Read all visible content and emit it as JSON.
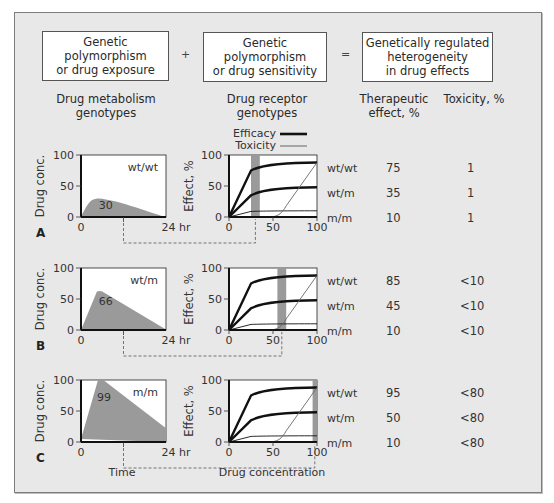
{
  "header": {
    "box1": "Genetic polymorphism or drug exposure",
    "box1_lines": [
      "Genetic polymorphism",
      "or drug exposure"
    ],
    "plus": "+",
    "box2_lines": [
      "Genetic",
      "polymorphism",
      "or drug sensitivity"
    ],
    "equals": "=",
    "box3_lines": [
      "Genetically regulated",
      "heterogeneity",
      "in drug effects"
    ]
  },
  "column_labels": {
    "metabolism": [
      "Drug metabolism",
      "genotypes"
    ],
    "receptor": [
      "Drug receptor",
      "genotypes"
    ],
    "therapeutic": [
      "Therapeutic",
      "effect, %"
    ],
    "toxicity": "Toxicity, %"
  },
  "legend": {
    "efficacy": "Efficacy",
    "toxicity": "Toxicity"
  },
  "axes": {
    "conc_ylabel": "Drug conc.",
    "effect_ylabel": "Effect, %",
    "conc_yticks": [
      "100",
      "50",
      "0"
    ],
    "conc_xticks": [
      "0",
      "24 hr"
    ],
    "effect_yticks": [
      "100",
      "50",
      "0"
    ],
    "effect_xticks": [
      "0",
      "50",
      "100"
    ],
    "time_label": "Time",
    "drug_conc_label": "Drug concentration"
  },
  "receptor_genotypes": [
    "wt/wt",
    "wt/m",
    "m/m"
  ],
  "panels": [
    {
      "letter": "A",
      "metabolism_genotype": "wt/wt",
      "peak_conc_label": "30",
      "peak_conc": 30,
      "shaded_band": [
        25,
        35
      ],
      "rows": [
        {
          "genotype": "wt/wt",
          "therapeutic": "75",
          "toxicity": "1"
        },
        {
          "genotype": "wt/m",
          "therapeutic": "35",
          "toxicity": "1"
        },
        {
          "genotype": "m/m",
          "therapeutic": "10",
          "toxicity": "1"
        }
      ]
    },
    {
      "letter": "B",
      "metabolism_genotype": "wt/m",
      "peak_conc_label": "66",
      "peak_conc": 63,
      "shaded_band": [
        55,
        65
      ],
      "rows": [
        {
          "genotype": "wt/wt",
          "therapeutic": "85",
          "toxicity": "<10"
        },
        {
          "genotype": "wt/m",
          "therapeutic": "45",
          "toxicity": "<10"
        },
        {
          "genotype": "m/m",
          "therapeutic": "10",
          "toxicity": "<10"
        }
      ]
    },
    {
      "letter": "C",
      "metabolism_genotype": "m/m",
      "peak_conc_label": "99",
      "peak_conc": 100,
      "shaded_band": [
        95,
        105
      ],
      "rows": [
        {
          "genotype": "wt/wt",
          "therapeutic": "95",
          "toxicity": "<80"
        },
        {
          "genotype": "wt/m",
          "therapeutic": "50",
          "toxicity": "<80"
        },
        {
          "genotype": "m/m",
          "therapeutic": "10",
          "toxicity": "<80"
        }
      ]
    }
  ],
  "chart_data": [
    {
      "type": "area",
      "title": "Drug concentration vs time (by drug metabolism genotype)",
      "xlabel": "Time",
      "ylabel": "Drug conc.",
      "xlim": [
        0,
        24
      ],
      "ylim": [
        0,
        100
      ],
      "series": [
        {
          "name": "wt/wt",
          "x": [
            0,
            5,
            24
          ],
          "y": [
            0,
            30,
            0
          ]
        },
        {
          "name": "wt/m",
          "x": [
            0,
            5,
            24
          ],
          "y": [
            0,
            63,
            0
          ]
        },
        {
          "name": "m/m",
          "x": [
            0,
            5,
            24
          ],
          "y": [
            0,
            100,
            22
          ]
        }
      ]
    },
    {
      "type": "line",
      "title": "Effect vs drug concentration (by drug receptor genotype)",
      "xlabel": "Drug concentration",
      "ylabel": "Effect, %",
      "xlim": [
        0,
        100
      ],
      "ylim": [
        0,
        100
      ],
      "series": [
        {
          "name": "Efficacy wt/wt",
          "x": [
            0,
            25,
            40,
            60,
            80,
            100
          ],
          "y": [
            0,
            75,
            82,
            86,
            88,
            88
          ]
        },
        {
          "name": "Efficacy wt/m",
          "x": [
            0,
            25,
            40,
            60,
            80,
            100
          ],
          "y": [
            0,
            35,
            41,
            45,
            47,
            48
          ]
        },
        {
          "name": "Efficacy m/m",
          "x": [
            0,
            25,
            40,
            60,
            80,
            100
          ],
          "y": [
            0,
            9,
            10,
            10,
            10,
            10
          ]
        },
        {
          "name": "Toxicity",
          "x": [
            0,
            45,
            55,
            62,
            70,
            85,
            100
          ],
          "y": [
            0,
            0,
            2,
            10,
            30,
            60,
            88
          ]
        }
      ]
    }
  ]
}
